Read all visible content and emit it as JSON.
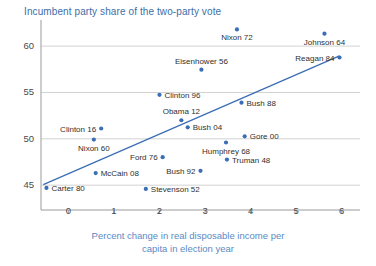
{
  "chart_data": {
    "type": "scatter",
    "title": "Incumbent party share of the two-party vote",
    "xlabel_line1": "Percent change in real disposable income per",
    "xlabel_line2": "capita in election year",
    "ylabel": "",
    "xlim": [
      -0.6,
      6.4
    ],
    "ylim": [
      43.4,
      62.6
    ],
    "xticks": [
      0,
      1,
      2,
      3,
      4,
      5,
      6
    ],
    "xtick_labels": [
      "0",
      "1",
      "2",
      "3",
      "4",
      "5",
      "6"
    ],
    "yticks": [
      45,
      50,
      55,
      60
    ],
    "ytick_labels": [
      "45",
      "50",
      "55",
      "60"
    ],
    "grid": "horizontal",
    "legend": "none",
    "colors": {
      "point": "#3b6eb4",
      "trendline": "#3b6eb4",
      "title": "#3d6ea8",
      "axis_title": "#5b8ac4",
      "label": "#2f2f2f",
      "gridline": "#d2d2d2",
      "axis": "#9a9a9a"
    },
    "trendline": {
      "x0": -0.55,
      "y0": 45.05,
      "x1": 5.95,
      "y1": 58.95
    },
    "points": [
      {
        "label": "Nixon 72",
        "x": 3.7,
        "y": 61.8,
        "pos": "below"
      },
      {
        "label": "Johnson 64",
        "x": 5.62,
        "y": 61.34,
        "pos": "below"
      },
      {
        "label": "Reagan 84",
        "x": 5.95,
        "y": 58.77,
        "pos": "left"
      },
      {
        "label": "Eisenhower 56",
        "x": 2.92,
        "y": 57.46,
        "pos": "above"
      },
      {
        "label": "Clinton 96",
        "x": 2.0,
        "y": 54.74,
        "pos": "right"
      },
      {
        "label": "Bush 88",
        "x": 3.8,
        "y": 53.9,
        "pos": "right"
      },
      {
        "label": "Obama 12",
        "x": 2.48,
        "y": 52.0,
        "pos": "above"
      },
      {
        "label": "Bush 04",
        "x": 2.62,
        "y": 51.24,
        "pos": "right"
      },
      {
        "label": "Clinton 16",
        "x": 0.72,
        "y": 51.11,
        "pos": "left"
      },
      {
        "label": "Gore 00",
        "x": 3.87,
        "y": 50.27,
        "pos": "right"
      },
      {
        "label": "Nixon 60",
        "x": 0.56,
        "y": 49.92,
        "pos": "below"
      },
      {
        "label": "Humphrey 68",
        "x": 3.46,
        "y": 49.6,
        "pos": "below"
      },
      {
        "label": "Ford 76",
        "x": 2.07,
        "y": 48.02,
        "pos": "left"
      },
      {
        "label": "Truman 48",
        "x": 3.48,
        "y": 47.76,
        "pos": "right"
      },
      {
        "label": "Bush 92",
        "x": 2.9,
        "y": 46.55,
        "pos": "left"
      },
      {
        "label": "McCain 08",
        "x": 0.6,
        "y": 46.3,
        "pos": "right"
      },
      {
        "label": "Carter 80",
        "x": -0.48,
        "y": 44.7,
        "pos": "right"
      },
      {
        "label": "Stevenson 52",
        "x": 1.7,
        "y": 44.6,
        "pos": "right"
      }
    ]
  }
}
